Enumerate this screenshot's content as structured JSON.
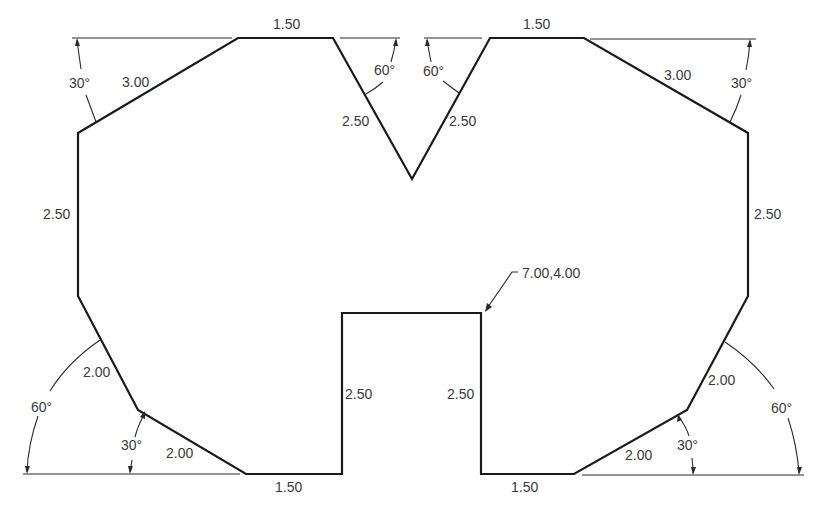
{
  "drawing": {
    "title": "",
    "units": "",
    "line_color": "#1a1a1a",
    "text_color": "#3a3a3a",
    "background": "#ffffff",
    "shape": "symmetric polygon with top V-notch and bottom rectangular notch"
  },
  "dimensions": {
    "top_left_edge_length": "1.50",
    "top_right_edge_length": "1.50",
    "top_left_chamfer_length": "3.00",
    "top_left_chamfer_angle": "30°",
    "top_right_chamfer_length": "3.00",
    "top_right_chamfer_angle": "30°",
    "v_left_length": "2.50",
    "v_left_angle": "60°",
    "v_right_length": "2.50",
    "v_right_angle": "60°",
    "left_side_length": "2.50",
    "right_side_length": "2.50",
    "lower_left_upper_chamfer_length": "2.00",
    "lower_left_upper_chamfer_angle": "60°",
    "lower_left_lower_chamfer_length": "2.00",
    "lower_left_lower_chamfer_angle": "30°",
    "lower_right_upper_chamfer_length": "2.00",
    "lower_right_upper_chamfer_angle": "60°",
    "lower_right_lower_chamfer_length": "2.00",
    "lower_right_lower_chamfer_angle": "30°",
    "notch_left_height": "2.50",
    "notch_right_height": "2.50",
    "bottom_left_edge_length": "1.50",
    "bottom_right_edge_length": "1.50",
    "coordinate_callout": "7.00,4.00"
  }
}
